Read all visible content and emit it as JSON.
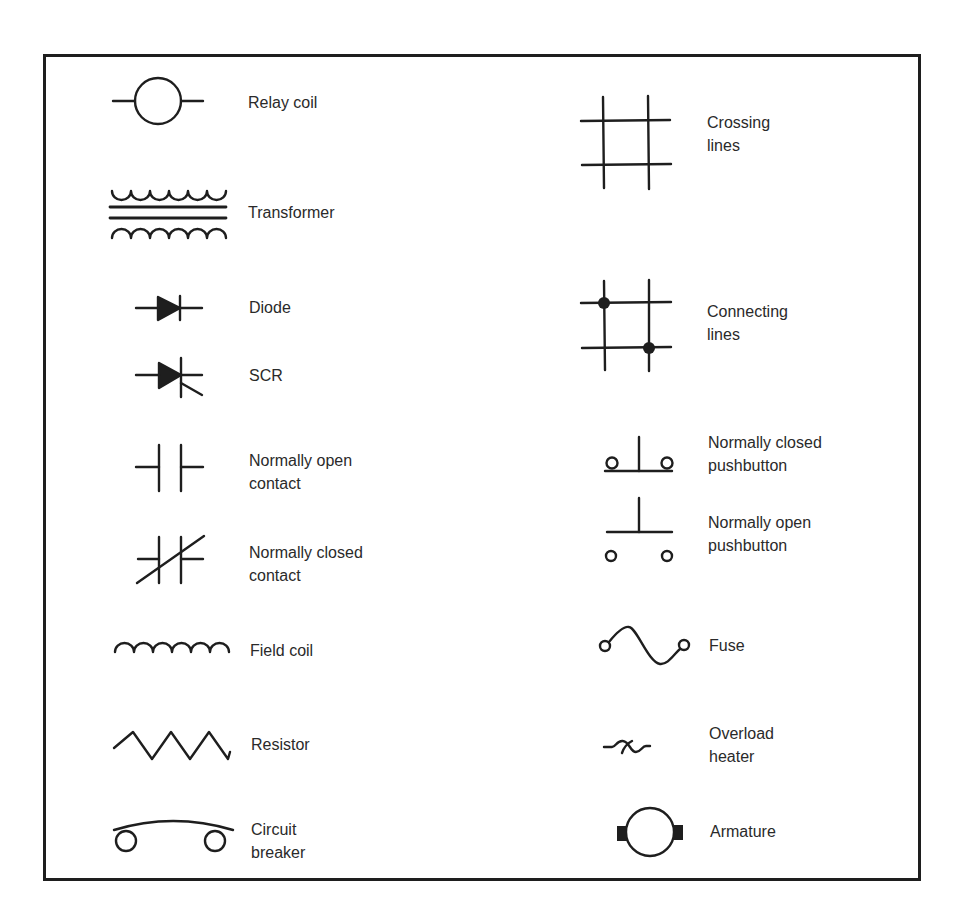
{
  "diagram": {
    "stroke_color": "#1e1e1e",
    "text_color": "#2a2a2a",
    "left_column": [
      {
        "id": "relay-coil",
        "label": "Relay coil",
        "icon": "relay-coil-icon"
      },
      {
        "id": "transformer",
        "label": "Transformer",
        "icon": "transformer-icon"
      },
      {
        "id": "diode",
        "label": "Diode",
        "icon": "diode-icon"
      },
      {
        "id": "scr",
        "label": "SCR",
        "icon": "scr-icon"
      },
      {
        "id": "no-contact",
        "label": "Normally open\ncontact",
        "icon": "normally-open-contact-icon"
      },
      {
        "id": "nc-contact",
        "label": "Normally closed\ncontact",
        "icon": "normally-closed-contact-icon"
      },
      {
        "id": "field-coil",
        "label": "Field coil",
        "icon": "field-coil-icon"
      },
      {
        "id": "resistor",
        "label": "Resistor",
        "icon": "resistor-icon"
      },
      {
        "id": "circuit-breaker",
        "label": "Circuit\nbreaker",
        "icon": "circuit-breaker-icon"
      }
    ],
    "right_column": [
      {
        "id": "crossing-lines",
        "label": "Crossing\nlines",
        "icon": "crossing-lines-icon"
      },
      {
        "id": "connecting-lines",
        "label": "Connecting\nlines",
        "icon": "connecting-lines-icon"
      },
      {
        "id": "nc-pushbutton",
        "label": "Normally closed\npushbutton",
        "icon": "normally-closed-pushbutton-icon"
      },
      {
        "id": "no-pushbutton",
        "label": "Normally open\npushbutton",
        "icon": "normally-open-pushbutton-icon"
      },
      {
        "id": "fuse",
        "label": "Fuse",
        "icon": "fuse-icon"
      },
      {
        "id": "overload-heater",
        "label": "Overload\nheater",
        "icon": "overload-heater-icon"
      },
      {
        "id": "armature",
        "label": "Armature",
        "icon": "armature-icon"
      }
    ]
  }
}
